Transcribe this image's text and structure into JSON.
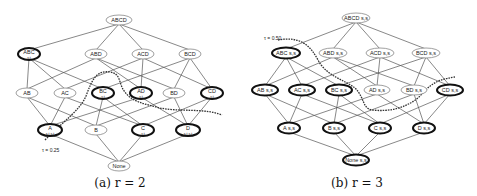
{
  "panels": [
    {
      "id": "a",
      "caption": "(a) r = 2",
      "threshold_label": "τ = 0.25",
      "nodes": {
        "ABCD": {
          "label": "ABCD",
          "sub": "",
          "bold": false
        },
        "ABC": {
          "label": "ABC",
          "sub": "s,t",
          "bold": true
        },
        "ABD": {
          "label": "ABD",
          "sub": "",
          "bold": false
        },
        "ACD": {
          "label": "ACD",
          "sub": "",
          "bold": false
        },
        "BCD": {
          "label": "BCD",
          "sub": "",
          "bold": false
        },
        "AB": {
          "label": "AB",
          "sub": "",
          "bold": false
        },
        "AC": {
          "label": "AC",
          "sub": "",
          "bold": false
        },
        "BC": {
          "label": "BC",
          "sub": "s,t",
          "bold": true
        },
        "AD": {
          "label": "AD",
          "sub": "s,t",
          "bold": true
        },
        "BD": {
          "label": "BD",
          "sub": "",
          "bold": false
        },
        "CD": {
          "label": "CD",
          "sub": "s,t",
          "bold": true
        },
        "A": {
          "label": "A",
          "sub": "s,t,s,t",
          "bold": true
        },
        "B": {
          "label": "B",
          "sub": "",
          "bold": false
        },
        "C": {
          "label": "C",
          "sub": "s,t",
          "bold": true
        },
        "D": {
          "label": "D",
          "sub": "s,t,s,t",
          "bold": true
        },
        "None": {
          "label": "None",
          "sub": "",
          "bold": false
        }
      }
    },
    {
      "id": "b",
      "caption": "(b) r = 3",
      "threshold_label": "τ = 0.50",
      "nodes": {
        "ABCD": {
          "label": "ABCD s,s",
          "bold": false
        },
        "ABC": {
          "label": "ABC s,s",
          "bold": true
        },
        "ABD": {
          "label": "ABD s,s",
          "bold": false
        },
        "ACD": {
          "label": "ACD s,s",
          "bold": false
        },
        "BCD": {
          "label": "BCD s,s",
          "bold": false
        },
        "AB": {
          "label": "AB s,s",
          "bold": true
        },
        "AC": {
          "label": "AC s,s",
          "bold": true
        },
        "BC": {
          "label": "BC s,s",
          "bold": true
        },
        "AD": {
          "label": "AD s,s",
          "bold": false
        },
        "BD": {
          "label": "BD s,s",
          "bold": false
        },
        "CD": {
          "label": "CD s,s",
          "bold": true
        },
        "A": {
          "label": "A s,s",
          "bold": true
        },
        "B": {
          "label": "B s,s",
          "bold": true
        },
        "C": {
          "label": "C s,s",
          "bold": true
        },
        "D": {
          "label": "D s,s",
          "bold": true
        },
        "None": {
          "label": "None s,s",
          "bold": true
        }
      }
    }
  ]
}
